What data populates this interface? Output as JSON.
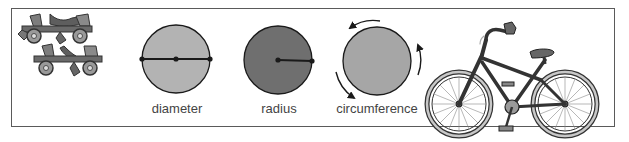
{
  "figure": {
    "labels": {
      "diameter": "diameter",
      "radius": "radius",
      "circumference": "circumference"
    },
    "items": [
      {
        "name": "roller-skates",
        "kind": "illustration"
      },
      {
        "name": "diameter-circle",
        "label": "diameter",
        "fill": "#b3b3b3"
      },
      {
        "name": "radius-circle",
        "label": "radius",
        "fill": "#6f6f6f"
      },
      {
        "name": "circumference-circle",
        "label": "circumference",
        "fill": "#a6a6a6"
      },
      {
        "name": "bicycle",
        "kind": "illustration"
      }
    ],
    "colors": {
      "frame": "#5a5a5a",
      "stroke": "#1a1a1a",
      "label": "#444444"
    }
  }
}
